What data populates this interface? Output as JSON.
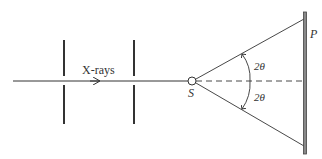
{
  "diagram": {
    "beam_label": "X-rays",
    "source_label": "S",
    "plate_label": "P",
    "upper_angle_label": "2θ",
    "lower_angle_label": "2θ"
  },
  "colors": {
    "line": "#333333",
    "plate": "#555555",
    "background": "#ffffff"
  }
}
